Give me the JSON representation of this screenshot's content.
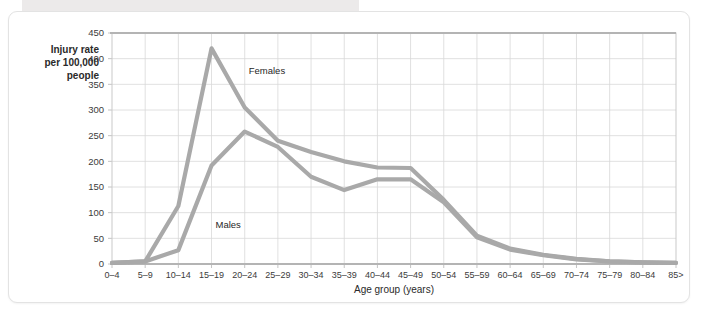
{
  "figure": {
    "y_axis_label_lines": [
      "Injury rate",
      "per 100,000",
      "people"
    ],
    "x_axis_title": "Age group (years)"
  },
  "colors": {
    "series_line": "#a9a9a9",
    "gridline": "#d8d8d8",
    "axis": "#b4b4b4",
    "text": "#2a2a2a",
    "card_background": "#ffffff",
    "page_band": "#eceaea"
  },
  "chart_data": {
    "type": "line",
    "title": "",
    "xlabel": "Age group (years)",
    "ylabel": "Injury rate per 100,000 people",
    "categories": [
      "0–4",
      "5–9",
      "10–14",
      "15–19",
      "20–24",
      "25–29",
      "30–34",
      "35–39",
      "40–44",
      "45–49",
      "50–54",
      "55–59",
      "60–64",
      "65–69",
      "70–74",
      "75–79",
      "80–84",
      "85>"
    ],
    "series": [
      {
        "name": "Females",
        "values": [
          2,
          5,
          113,
          420,
          305,
          240,
          218,
          200,
          188,
          187,
          125,
          55,
          30,
          18,
          10,
          5,
          3,
          2
        ]
      },
      {
        "name": "Males",
        "values": [
          2,
          5,
          27,
          192,
          258,
          228,
          170,
          144,
          165,
          165,
          120,
          52,
          28,
          17,
          9,
          5,
          3,
          2
        ]
      }
    ],
    "ylim": [
      0,
      450
    ],
    "ytick_values": [
      0,
      50,
      100,
      150,
      200,
      250,
      300,
      350,
      400,
      450
    ],
    "ytick_labels": [
      "0",
      "50",
      "100",
      "150",
      "200",
      "250",
      "300",
      "350",
      "400",
      "450"
    ],
    "grid": true,
    "legend": "inline-annotations",
    "annotations": [
      {
        "text": "Females",
        "category": "20–24",
        "value": 370
      },
      {
        "text": "Males",
        "category": "15–19",
        "value": 70
      }
    ]
  }
}
